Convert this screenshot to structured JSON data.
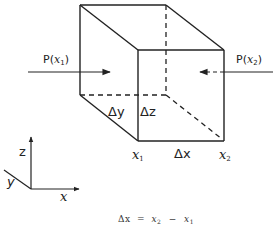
{
  "diagram": {
    "colors": {
      "line": "#222222",
      "background": "#ffffff"
    },
    "cube": {
      "vertices": {
        "back_top_left": [
          80,
          5
        ],
        "back_top_right": [
          166,
          5
        ],
        "front_top_left": [
          138,
          50
        ],
        "front_top_right": [
          224,
          50
        ],
        "back_bottom_left": [
          80,
          95
        ],
        "back_bottom_right": [
          166,
          95
        ],
        "front_bottom_left": [
          138,
          141
        ],
        "front_bottom_right": [
          224,
          141
        ]
      },
      "hidden_edges_dashed": true
    },
    "labels": {
      "p_x1": {
        "prefix": "P(",
        "var": "x",
        "sub": "1",
        "suffix": ")"
      },
      "p_x2": {
        "prefix": "P(",
        "var": "x",
        "sub": "2",
        "suffix": ")"
      },
      "delta_y": "Δy",
      "delta_z": "Δz",
      "delta_x": "Δx",
      "x1": {
        "var": "x",
        "sub": "1"
      },
      "x2": {
        "var": "x",
        "sub": "2"
      }
    },
    "arrows": {
      "p_x1": {
        "from": [
          28,
          72
        ],
        "to": [
          110,
          72
        ],
        "style": "solid"
      },
      "p_x2": {
        "from": [
          273,
          72
        ],
        "to": [
          199,
          72
        ],
        "style": "dashed-inside"
      }
    },
    "axes": {
      "origin": [
        31,
        189
      ],
      "z": {
        "label": "z",
        "end": [
          31,
          137
        ]
      },
      "x": {
        "label": "x",
        "end": [
          79,
          189
        ]
      },
      "y": {
        "label": "y",
        "end": [
          4,
          170
        ]
      }
    },
    "formula": {
      "lhs": "Δx",
      "eq": "=",
      "rhs_a_var": "x",
      "rhs_a_sub": "2",
      "minus": "−",
      "rhs_b_var": "x",
      "rhs_b_sub": "1"
    }
  }
}
